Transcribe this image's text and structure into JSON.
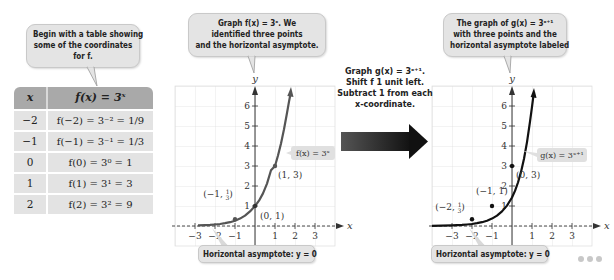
{
  "callouts": {
    "table_note": [
      "Begin with a table showing",
      "some of the coordinates",
      "for f."
    ],
    "left_graph_note": [
      "Graph f(x) = 3ˣ. We",
      "identified three points",
      "and the horizontal asymptote."
    ],
    "middle_note": [
      "Graph g(x) = 3ˣ⁺¹.",
      "Shift f 1 unit left.",
      "Subtract 1 from each",
      "x-coordinate."
    ],
    "right_graph_note": [
      "The graph of g(x) = 3ˣ⁺¹",
      "with three points and the",
      "horizontal asymptote labeled"
    ],
    "left_asymptote": "Horizontal asymptote: y = 0",
    "right_asymptote": "Horizontal asymptote: y = 0"
  },
  "table": {
    "headers": [
      "x",
      "f(x) = 3ˣ"
    ],
    "rows": [
      {
        "x": "−2",
        "fx": "f(−2) = 3⁻² = 1/9"
      },
      {
        "x": "−1",
        "fx": "f(−1) = 3⁻¹ = 1/3"
      },
      {
        "x": "0",
        "fx": "f(0) = 3⁰ = 1"
      },
      {
        "x": "1",
        "fx": "f(1) = 3¹ = 3"
      },
      {
        "x": "2",
        "fx": "f(2) = 3² = 9"
      }
    ]
  },
  "left_graph": {
    "function_label": "f(x) = 3ˣ",
    "x_axis_label": "x",
    "y_axis_label": "y",
    "x_ticks": [
      "−3",
      "−2",
      "−1",
      "1",
      "2",
      "3"
    ],
    "y_ticks": [
      "1",
      "2",
      "3",
      "4",
      "5",
      "6"
    ],
    "point_labels": [
      "(−1, 1/3)",
      "(0, 1)",
      "(1, 3)"
    ],
    "curve_color": "#555555"
  },
  "right_graph": {
    "function_label": "g(x) = 3ˣ⁺¹",
    "x_axis_label": "x",
    "y_axis_label": "y",
    "x_ticks": [
      "−3",
      "−2",
      "−1",
      "1",
      "2",
      "3"
    ],
    "y_ticks": [
      "1",
      "2",
      "3",
      "4",
      "5",
      "6"
    ],
    "point_labels": [
      "(−2, 1/3)",
      "(−1, 1)",
      "(0, 3)"
    ],
    "curve_color": "#111111"
  },
  "colors": {
    "callout_bg": "#e4e4e4",
    "table_header": "#a9a9a9",
    "table_row": "#e3e3e3",
    "grid": "#dddddd",
    "arrow_gradient_start": "#555555",
    "arrow_gradient_end": "#111111"
  }
}
